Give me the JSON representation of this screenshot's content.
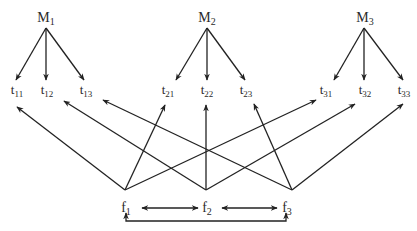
{
  "diagram": {
    "managers": [
      {
        "id": "M1",
        "base": "M",
        "sub": "1",
        "x": 46,
        "y": 22
      },
      {
        "id": "M2",
        "base": "M",
        "sub": "2",
        "x": 207,
        "y": 22
      },
      {
        "id": "M3",
        "base": "M",
        "sub": "3",
        "x": 365,
        "y": 22
      }
    ],
    "tasks": [
      {
        "id": "t11",
        "base": "t",
        "sub": "11",
        "x": 17,
        "y": 94
      },
      {
        "id": "t12",
        "base": "t",
        "sub": "12",
        "x": 47,
        "y": 94
      },
      {
        "id": "t13",
        "base": "t",
        "sub": "13",
        "x": 86,
        "y": 94
      },
      {
        "id": "t21",
        "base": "t",
        "sub": "21",
        "x": 168,
        "y": 94
      },
      {
        "id": "t22",
        "base": "t",
        "sub": "22",
        "x": 207,
        "y": 94
      },
      {
        "id": "t23",
        "base": "t",
        "sub": "23",
        "x": 246,
        "y": 94
      },
      {
        "id": "t31",
        "base": "t",
        "sub": "31",
        "x": 326,
        "y": 94
      },
      {
        "id": "t32",
        "base": "t",
        "sub": "32",
        "x": 365,
        "y": 94
      },
      {
        "id": "t33",
        "base": "t",
        "sub": "33",
        "x": 404,
        "y": 94
      }
    ],
    "factors": [
      {
        "id": "f1",
        "base": "f",
        "sub": "1",
        "x": 126,
        "y": 212
      },
      {
        "id": "f2",
        "base": "f",
        "sub": "2",
        "x": 207,
        "y": 212
      },
      {
        "id": "f3",
        "base": "f",
        "sub": "3",
        "x": 287,
        "y": 212
      }
    ],
    "edges_manager_to_task": [
      {
        "from": "M1",
        "to": "t11",
        "x1": 46,
        "y1": 28,
        "x2": 16,
        "y2": 80
      },
      {
        "from": "M1",
        "to": "t12",
        "x1": 46,
        "y1": 28,
        "x2": 46,
        "y2": 80
      },
      {
        "from": "M1",
        "to": "t13",
        "x1": 46,
        "y1": 28,
        "x2": 84,
        "y2": 80
      },
      {
        "from": "M2",
        "to": "t21",
        "x1": 207,
        "y1": 28,
        "x2": 176,
        "y2": 80
      },
      {
        "from": "M2",
        "to": "t22",
        "x1": 207,
        "y1": 28,
        "x2": 207,
        "y2": 80
      },
      {
        "from": "M2",
        "to": "t23",
        "x1": 207,
        "y1": 28,
        "x2": 245,
        "y2": 80
      },
      {
        "from": "M3",
        "to": "t31",
        "x1": 364,
        "y1": 28,
        "x2": 334,
        "y2": 80
      },
      {
        "from": "M3",
        "to": "t32",
        "x1": 364,
        "y1": 28,
        "x2": 364,
        "y2": 80
      },
      {
        "from": "M3",
        "to": "t33",
        "x1": 364,
        "y1": 28,
        "x2": 403,
        "y2": 80
      }
    ],
    "edges_factor_to_task": [
      {
        "from": "f1",
        "to": "t11",
        "x1": 125,
        "y1": 190,
        "x2": 17,
        "y2": 107
      },
      {
        "from": "f1",
        "to": "t21",
        "x1": 125,
        "y1": 190,
        "x2": 165,
        "y2": 105
      },
      {
        "from": "f1",
        "to": "t31",
        "x1": 125,
        "y1": 190,
        "x2": 316,
        "y2": 100
      },
      {
        "from": "f2",
        "to": "t12",
        "x1": 206,
        "y1": 190,
        "x2": 64,
        "y2": 101
      },
      {
        "from": "f2",
        "to": "t22",
        "x1": 206,
        "y1": 190,
        "x2": 206,
        "y2": 105
      },
      {
        "from": "f2",
        "to": "t32",
        "x1": 206,
        "y1": 190,
        "x2": 355,
        "y2": 104
      },
      {
        "from": "f3",
        "to": "t13",
        "x1": 292,
        "y1": 190,
        "x2": 103,
        "y2": 100
      },
      {
        "from": "f3",
        "to": "t23",
        "x1": 292,
        "y1": 190,
        "x2": 254,
        "y2": 104
      },
      {
        "from": "f3",
        "to": "t33",
        "x1": 292,
        "y1": 190,
        "x2": 403,
        "y2": 104
      }
    ],
    "edges_factor_bidirectional": [
      {
        "from": "f1",
        "to": "f2",
        "x1": 142,
        "y1": 208,
        "x2": 198,
        "y2": 208
      },
      {
        "from": "f2",
        "to": "f3",
        "x1": 222,
        "y1": 208,
        "x2": 277,
        "y2": 208
      }
    ],
    "edge_factor_bracket": {
      "from": "f1",
      "to": "f3",
      "x1": 126,
      "x2": 286,
      "y_bottom": 221,
      "y_top": 213
    }
  }
}
